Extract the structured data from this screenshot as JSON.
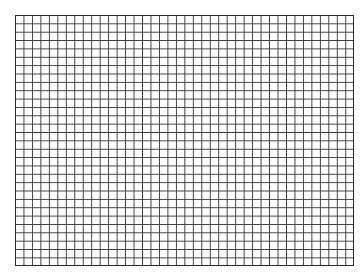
{
  "grid": {
    "columns": 40,
    "rows": 30,
    "line_color": "#3a3a3a",
    "border_color": "#2a2a2a",
    "background": "#ffffff"
  }
}
